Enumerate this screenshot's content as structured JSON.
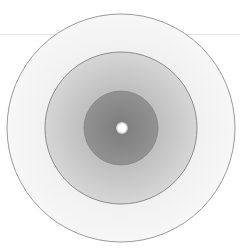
{
  "figure": {
    "center": [
      121,
      128
    ],
    "rings": [
      {
        "name": "outer",
        "radius": 114,
        "fill": "#f2f2f2",
        "stroke": "#9a9a9a"
      },
      {
        "name": "middle",
        "radius": 76,
        "fill": "#c4c4c4",
        "stroke": "#8c8c8c"
      },
      {
        "name": "inner",
        "radius": 37,
        "fill": "#8e8e8e",
        "stroke": "#7a7a7a"
      }
    ],
    "center_dot": {
      "radius": 5,
      "fill": "#ffffff"
    },
    "guide_line_y": 34
  }
}
